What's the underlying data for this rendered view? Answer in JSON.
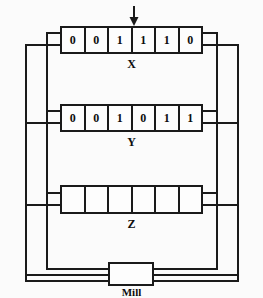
{
  "diagram": {
    "background_color": "#fbfbfb",
    "line_color": "#1a1a1a",
    "registers": [
      {
        "name": "X",
        "label": "X",
        "cells": [
          "0",
          "0",
          "1",
          "1",
          "1",
          "0"
        ],
        "cell_count": 6
      },
      {
        "name": "Y",
        "label": "Y",
        "cells": [
          "0",
          "0",
          "1",
          "0",
          "1",
          "1"
        ],
        "cell_count": 6
      },
      {
        "name": "Z",
        "label": "Z",
        "cells": [
          "",
          "",
          "",
          "",
          "",
          ""
        ],
        "cell_count": 6
      }
    ],
    "mill": {
      "label": "Mill"
    },
    "pointer": {
      "icon": "down-arrow-icon",
      "target_register": "X"
    }
  }
}
